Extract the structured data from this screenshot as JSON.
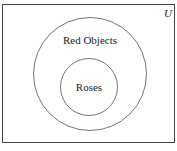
{
  "diagram": {
    "type": "venn",
    "universe": {
      "label": "U"
    },
    "sets": [
      {
        "label": "Red Objects",
        "contains": [
          "Roses"
        ]
      },
      {
        "label": "Roses"
      }
    ],
    "colors": {
      "stroke": "#555555",
      "frame": "#444444",
      "background": "#ffffff"
    }
  }
}
